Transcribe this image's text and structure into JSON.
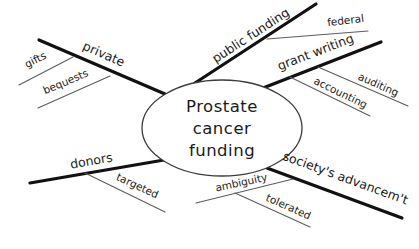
{
  "diagram": {
    "center": {
      "lines": [
        "Prostate",
        "cancer",
        "funding"
      ]
    },
    "branches": [
      {
        "label": "private",
        "children": [
          {
            "label": "gifts"
          },
          {
            "label": "bequests"
          }
        ]
      },
      {
        "label": "public funding",
        "children": [
          {
            "label": "federal"
          }
        ]
      },
      {
        "label": "grant writing",
        "children": [
          {
            "label": "auditing"
          },
          {
            "label": "accounting"
          }
        ]
      },
      {
        "label": "donors",
        "children": [
          {
            "label": "targeted"
          }
        ]
      },
      {
        "label": "society's advancem't",
        "children": [
          {
            "label": "ambiguity",
            "children": [
              {
                "label": "tolerated"
              }
            ]
          }
        ]
      }
    ],
    "colors": {
      "branch_line": "#111111",
      "sub_line": "#5c5c5c",
      "text": "#1a1a1a",
      "background": "#ffffff"
    }
  }
}
